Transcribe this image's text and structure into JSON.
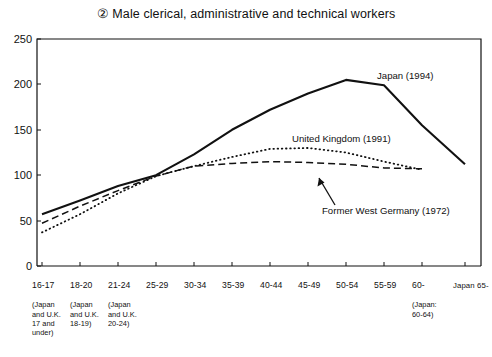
{
  "chart_data": {
    "type": "line",
    "title": "② Male clerical, administrative and technical workers",
    "xlabel": "",
    "ylabel": "",
    "ylim": [
      0,
      250
    ],
    "yticks": [
      0,
      50,
      100,
      150,
      200,
      250
    ],
    "grid": false,
    "legend_position": "inline-annotations",
    "categories": [
      "16-17",
      "18-20",
      "21-24",
      "25-29",
      "30-34",
      "35-39",
      "40-44",
      "45-49",
      "50-54",
      "55-59",
      "60-",
      "Japan 65-"
    ],
    "category_sublabels": [
      "(Japan\nand U.K.\n17 and\nunder)",
      "(Japan\nand U.K.\n18-19)",
      "(Japan\nand U.K.\n20-24)",
      "",
      "",
      "",
      "",
      "",
      "",
      "",
      "(Japan:\n60-64)",
      ""
    ],
    "series": [
      {
        "name": "Japan (1994)",
        "style": "solid",
        "color": "#111111",
        "values": [
          57,
          72,
          88,
          100,
          123,
          150,
          172,
          190,
          205,
          199,
          155,
          112
        ]
      },
      {
        "name": "United Kingdom (1991)",
        "style": "dotted",
        "color": "#111111",
        "values": [
          37,
          57,
          80,
          99,
          110,
          120,
          129,
          130,
          125,
          115,
          106,
          null
        ]
      },
      {
        "name": "Former West Germany (1972)",
        "style": "dashed",
        "color": "#111111",
        "values": [
          47,
          66,
          83,
          99,
          110,
          113,
          115,
          114,
          112,
          108,
          107,
          null
        ]
      }
    ],
    "annotations": [
      {
        "text": "Japan (1994)",
        "arrow": false
      },
      {
        "text": "United Kingdom (1991)",
        "arrow": false
      },
      {
        "text": "Former West Germany (1972)",
        "arrow": true
      }
    ]
  }
}
